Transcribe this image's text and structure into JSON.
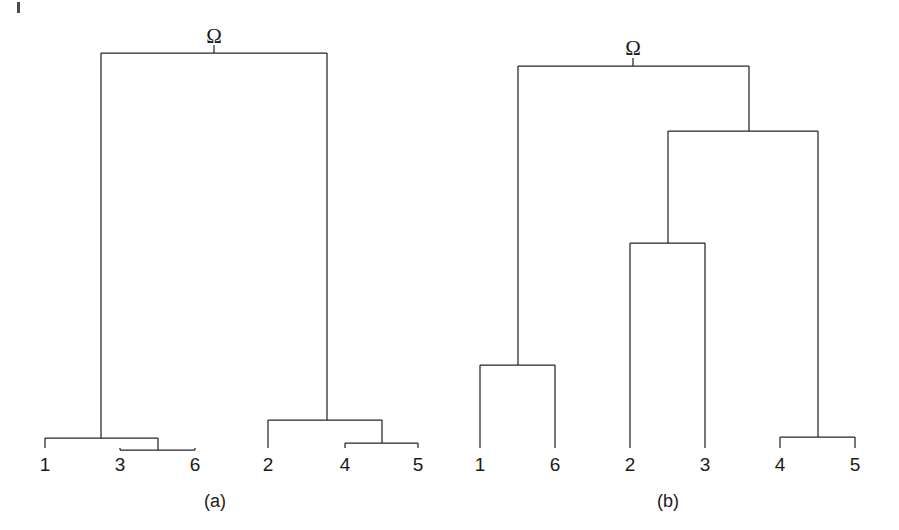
{
  "figure": {
    "background_color": "#ffffff",
    "line_color": "#262626",
    "text_color": "#1a1a1a",
    "width": 899,
    "height": 530
  },
  "artifact": {
    "name": "scan-speck",
    "x": 17,
    "y": 2,
    "width": 3,
    "height": 11
  },
  "panels": [
    {
      "id": "a",
      "caption": "(a)",
      "caption_x": 215,
      "caption_y": 492,
      "root_label": "Ω",
      "root_label_x": 214,
      "root_label_y": 26,
      "root_stub": {
        "x": 214,
        "y_top": 45,
        "y_bottom": 53
      },
      "leaves": [
        {
          "label": "1",
          "x": 45,
          "y_label": 455,
          "y_tick_top": 438
        },
        {
          "label": "3",
          "x": 120,
          "y_label": 455,
          "y_tick_top": 450
        },
        {
          "label": "6",
          "x": 195,
          "y_label": 455,
          "y_tick_top": 450
        },
        {
          "label": "2",
          "x": 268,
          "y_label": 455,
          "y_tick_top": 420
        },
        {
          "label": "4",
          "x": 345,
          "y_label": 455,
          "y_tick_top": 443
        },
        {
          "label": "5",
          "x": 418,
          "y_label": 455,
          "y_tick_top": 443
        }
      ],
      "nodes": [
        {
          "name": "root",
          "y": 53,
          "x_left": 101,
          "x_right": 327,
          "children_x": [
            101,
            327
          ]
        },
        {
          "name": "cluster-136",
          "y": 438,
          "x_left": 45,
          "x_right": 158,
          "children_x": [
            45,
            158
          ]
        },
        {
          "name": "cluster-36",
          "y": 450,
          "x_left": 120,
          "x_right": 195,
          "children_x": [
            120,
            195
          ]
        },
        {
          "name": "cluster-245",
          "y": 420,
          "x_left": 268,
          "x_right": 382,
          "children_x": [
            268,
            382
          ]
        },
        {
          "name": "cluster-45",
          "y": 443,
          "x_left": 345,
          "x_right": 418,
          "children_x": [
            345,
            418
          ]
        }
      ],
      "stems": [
        {
          "name": "root-to-left-cluster",
          "x": 101,
          "y_top": 53,
          "y_bottom": 438
        },
        {
          "name": "root-to-right-cluster",
          "x": 327,
          "y_top": 53,
          "y_bottom": 420
        },
        {
          "name": "node36-stem",
          "x": 158,
          "y_top": 438,
          "y_bottom": 450
        },
        {
          "name": "node45-stem",
          "x": 382,
          "y_top": 420,
          "y_bottom": 443
        },
        {
          "name": "leaf-1-stem",
          "x": 45,
          "y_top": 438,
          "y_bottom": 448
        },
        {
          "name": "leaf-3-stem",
          "x": 120,
          "y_top": 450,
          "y_bottom": 448
        },
        {
          "name": "leaf-6-stem",
          "x": 195,
          "y_top": 450,
          "y_bottom": 448
        },
        {
          "name": "leaf-2-stem",
          "x": 268,
          "y_top": 420,
          "y_bottom": 448
        },
        {
          "name": "leaf-4-stem",
          "x": 345,
          "y_top": 443,
          "y_bottom": 448
        },
        {
          "name": "leaf-5-stem",
          "x": 418,
          "y_top": 443,
          "y_bottom": 448
        }
      ]
    },
    {
      "id": "b",
      "caption": "(b)",
      "caption_x": 668,
      "caption_y": 492,
      "root_label": "Ω",
      "root_label_x": 633,
      "root_label_y": 38,
      "root_stub": {
        "x": 633,
        "y_top": 58,
        "y_bottom": 66
      },
      "leaves": [
        {
          "label": "1",
          "x": 480,
          "y_label": 455,
          "y_tick_top": 365
        },
        {
          "label": "6",
          "x": 555,
          "y_label": 455,
          "y_tick_top": 365
        },
        {
          "label": "2",
          "x": 630,
          "y_label": 455,
          "y_tick_top": 243
        },
        {
          "label": "3",
          "x": 705,
          "y_label": 455,
          "y_tick_top": 243
        },
        {
          "label": "4",
          "x": 780,
          "y_label": 455,
          "y_tick_top": 437
        },
        {
          "label": "5",
          "x": 855,
          "y_label": 455,
          "y_tick_top": 437
        }
      ],
      "nodes": [
        {
          "name": "root",
          "y": 66,
          "x_left": 518,
          "x_right": 749,
          "children_x": [
            518,
            749
          ]
        },
        {
          "name": "cluster-2345",
          "y": 131,
          "x_left": 668,
          "x_right": 818,
          "children_x": [
            668,
            818
          ]
        },
        {
          "name": "cluster-23",
          "y": 243,
          "x_left": 630,
          "x_right": 705,
          "children_x": [
            630,
            705
          ]
        },
        {
          "name": "cluster-16",
          "y": 365,
          "x_left": 480,
          "x_right": 555,
          "children_x": [
            480,
            555
          ]
        },
        {
          "name": "cluster-45",
          "y": 437,
          "x_left": 780,
          "x_right": 855,
          "children_x": [
            780,
            855
          ]
        }
      ],
      "stems": [
        {
          "name": "root-to-cluster16",
          "x": 518,
          "y_top": 66,
          "y_bottom": 365
        },
        {
          "name": "root-to-cluster2345",
          "x": 749,
          "y_top": 66,
          "y_bottom": 131
        },
        {
          "name": "cluster2345-to-23",
          "x": 668,
          "y_top": 131,
          "y_bottom": 243
        },
        {
          "name": "cluster2345-to-45",
          "x": 818,
          "y_top": 131,
          "y_bottom": 437
        },
        {
          "name": "leaf-1-stem",
          "x": 480,
          "y_top": 365,
          "y_bottom": 448
        },
        {
          "name": "leaf-6-stem",
          "x": 555,
          "y_top": 365,
          "y_bottom": 448
        },
        {
          "name": "leaf-2-stem",
          "x": 630,
          "y_top": 243,
          "y_bottom": 448
        },
        {
          "name": "leaf-3-stem",
          "x": 705,
          "y_top": 243,
          "y_bottom": 448
        },
        {
          "name": "leaf-4-stem",
          "x": 780,
          "y_top": 437,
          "y_bottom": 448
        },
        {
          "name": "leaf-5-stem",
          "x": 855,
          "y_top": 437,
          "y_bottom": 448
        }
      ]
    }
  ],
  "chart_data": {
    "type": "diagram",
    "subtype": "dendrogram-pair",
    "title": "",
    "xlabel": "",
    "ylabel": "",
    "panels": [
      {
        "id": "a",
        "caption": "(a)",
        "root": "Ω",
        "leaf_order": [
          "1",
          "3",
          "6",
          "2",
          "4",
          "5"
        ],
        "merges": [
          {
            "cluster": [
              "3",
              "6"
            ],
            "height": 0.03
          },
          {
            "cluster": [
              "4",
              "5"
            ],
            "height": 0.04
          },
          {
            "cluster": [
              "1",
              "3",
              "6"
            ],
            "height": 0.06
          },
          {
            "cluster": [
              "2",
              "4",
              "5"
            ],
            "height": 0.11
          },
          {
            "cluster": [
              "1",
              "3",
              "6",
              "2",
              "4",
              "5"
            ],
            "height": 1.0
          }
        ],
        "description": "Two well-separated clusters {1,3,6} and {2,4,5} joined only at the root."
      },
      {
        "id": "b",
        "caption": "(b)",
        "root": "Ω",
        "leaf_order": [
          "1",
          "6",
          "2",
          "3",
          "4",
          "5"
        ],
        "merges": [
          {
            "cluster": [
              "4",
              "5"
            ],
            "height": 0.03
          },
          {
            "cluster": [
              "2",
              "3"
            ],
            "height": 0.54
          },
          {
            "cluster": [
              "1",
              "6"
            ],
            "height": 0.22
          },
          {
            "cluster": [
              "2",
              "3",
              "4",
              "5"
            ],
            "height": 0.83
          },
          {
            "cluster": [
              "1",
              "6",
              "2",
              "3",
              "4",
              "5"
            ],
            "height": 1.0
          }
        ],
        "description": "Chained structure: {4,5} merges with {2,3}, then that group merges with {1,6} at the root."
      }
    ]
  }
}
